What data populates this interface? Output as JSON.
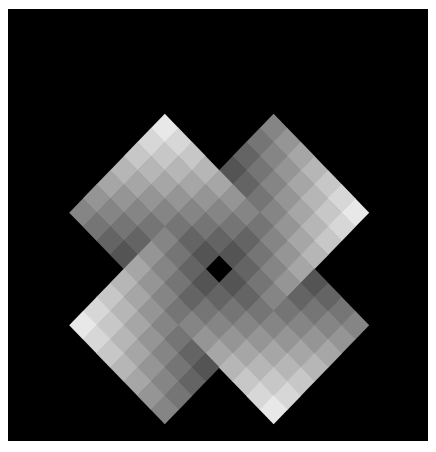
{
  "artwork": {
    "title": "Pinwheel of four graded diamond squares",
    "background": "#000000",
    "page_background": "#ffffff",
    "frame": {
      "x": 8,
      "y": 9,
      "width": 420,
      "height": 432
    },
    "lattice": {
      "origin_x": 56,
      "origin_y": 100,
      "step_x": 13.6,
      "step_y": 14.08,
      "size": 24
    },
    "gray_levels": {
      "brightest": 248,
      "darkest": 18,
      "steps": 15
    },
    "squares": [
      {
        "id": "top-left",
        "center": [
          8,
          8
        ],
        "half_size": 8,
        "bright_side": "top"
      },
      {
        "id": "top-right",
        "center": [
          16,
          8
        ],
        "half_size": 8,
        "bright_side": "right"
      },
      {
        "id": "bottom-right",
        "center": [
          16,
          16
        ],
        "half_size": 8,
        "bright_side": "bottom"
      },
      {
        "id": "bottom-left",
        "center": [
          8,
          16
        ],
        "half_size": 8,
        "bright_side": "left"
      }
    ],
    "overlap_order": [
      {
        "over": "top-left",
        "under": "top-right"
      },
      {
        "over": "top-right",
        "under": "bottom-right"
      },
      {
        "over": "bottom-right",
        "under": "bottom-left"
      },
      {
        "over": "bottom-left",
        "under": "top-left"
      }
    ],
    "center_gray": 10
  }
}
